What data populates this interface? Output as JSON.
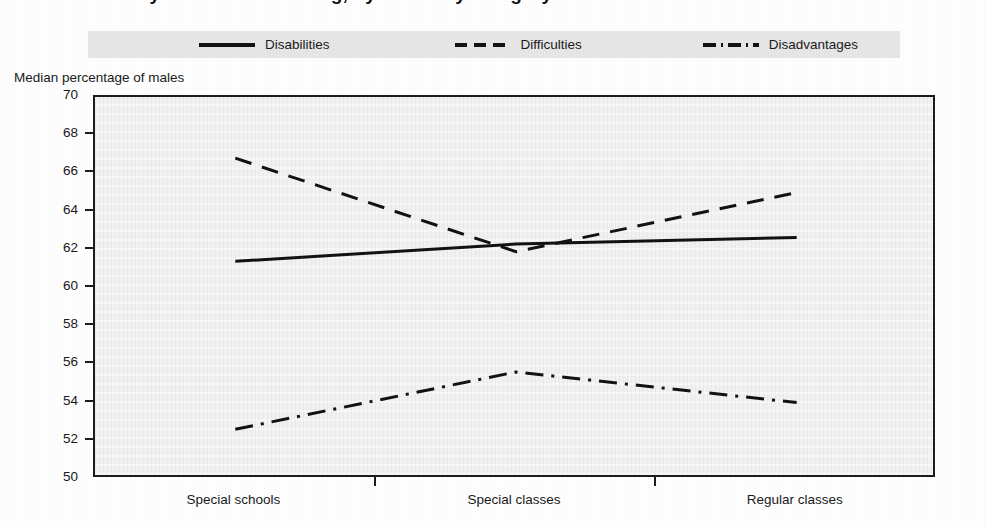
{
  "figure": {
    "title_cropped": "Gender ratios by educational setting, by disability category",
    "background_color": "#fefefe",
    "plot_background_color": "#f2f2f2",
    "legend_background_color": "#e6e6e6",
    "line_color": "#121212"
  },
  "legend": {
    "items": [
      {
        "label": "Disabilities",
        "style": "solid",
        "swatch": "solid-line-swatch"
      },
      {
        "label": "Difficulties",
        "style": "dashed",
        "swatch": "dashed-line-swatch"
      },
      {
        "label": "Disadvantages",
        "style": "dash-dotted",
        "swatch": "dash-dot-line-swatch"
      }
    ]
  },
  "axes": {
    "y_title": "Median percentage of males",
    "y_ticks": [
      "70",
      "68",
      "66",
      "64",
      "62",
      "60",
      "58",
      "56",
      "54",
      "52",
      "50"
    ],
    "x_categories": [
      "Special schools",
      "Special classes",
      "Regular classes"
    ]
  },
  "chart_data": {
    "type": "line",
    "title": "Gender ratios by educational setting, by disability category",
    "xlabel": "",
    "ylabel": "Median percentage of males",
    "categories": [
      "Special schools",
      "Special classes",
      "Regular classes"
    ],
    "ylim": [
      50,
      70
    ],
    "ytick_step": 2,
    "yticks": [
      50,
      52,
      54,
      56,
      58,
      60,
      62,
      64,
      66,
      68,
      70
    ],
    "grid": false,
    "legend_position": "top",
    "series": [
      {
        "name": "Disabilities",
        "style": "solid",
        "values": [
          61.4,
          62.3,
          62.65
        ]
      },
      {
        "name": "Difficulties",
        "style": "dashed",
        "values": [
          66.8,
          61.9,
          65.0
        ]
      },
      {
        "name": "Disadvantages",
        "style": "dash-dotted",
        "values": [
          52.6,
          55.6,
          54.0
        ]
      }
    ]
  }
}
